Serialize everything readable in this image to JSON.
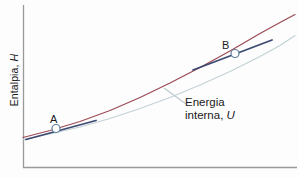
{
  "figure": {
    "background_color": "#fdfdfd",
    "axis_color": "#9a9a9a"
  },
  "axes": {
    "y_label_text": "Entalpia, ",
    "y_label_symbol": "H",
    "x_label_text": ""
  },
  "annotation": {
    "line1": "Energia",
    "line2": "interna, ",
    "symbol": "U"
  },
  "markers": {
    "a_label": "A",
    "b_label": "B"
  },
  "chart_data": {
    "type": "line",
    "title": "",
    "xlabel": "",
    "ylabel": "Entalpia, H",
    "grid": false,
    "legend_position": "inline-annotation",
    "axis_ranges": {
      "x_pixels": [
        23,
        297
      ],
      "y_pixels": [
        5,
        168
      ]
    },
    "series": [
      {
        "name": "Entalpia, H",
        "color": "#9b4a55",
        "width": 1.2,
        "points": [
          [
            23,
            137.5
          ],
          [
            50,
            130.5
          ],
          [
            80,
            121.5
          ],
          [
            110,
            110.5
          ],
          [
            140,
            97.5
          ],
          [
            170,
            83.0
          ],
          [
            200,
            67.5
          ],
          [
            230,
            51.0
          ],
          [
            260,
            33.5
          ],
          [
            280,
            22.5
          ],
          [
            295,
            14.5
          ]
        ]
      },
      {
        "name": "Energia interna, U",
        "color": "#c3d2d6",
        "width": 1.2,
        "points": [
          [
            23,
            139.5
          ],
          [
            50,
            134.0
          ],
          [
            80,
            127.0
          ],
          [
            110,
            118.5
          ],
          [
            140,
            108.5
          ],
          [
            170,
            97.5
          ],
          [
            200,
            85.0
          ],
          [
            230,
            71.5
          ],
          [
            260,
            56.5
          ],
          [
            280,
            45.5
          ],
          [
            295,
            35.5
          ]
        ]
      }
    ],
    "tangents": [
      {
        "name": "tangent-at-A",
        "color": "#3c4a72",
        "x1": 26,
        "y1": 139.5,
        "x2": 96,
        "y2": 120.5
      },
      {
        "name": "tangent-at-B",
        "color": "#3c4a72",
        "x1": 193,
        "y1": 70.0,
        "x2": 272,
        "y2": 40.0
      }
    ],
    "points": [
      {
        "label": "A",
        "x": 56,
        "y": 128.5,
        "marker": "open-circle"
      },
      {
        "label": "B",
        "x": 235,
        "y": 53.5,
        "marker": "open-circle"
      }
    ],
    "leader_line": {
      "x1": 164,
      "y1": 88.0,
      "x2": 186,
      "y2": 104.0
    }
  }
}
